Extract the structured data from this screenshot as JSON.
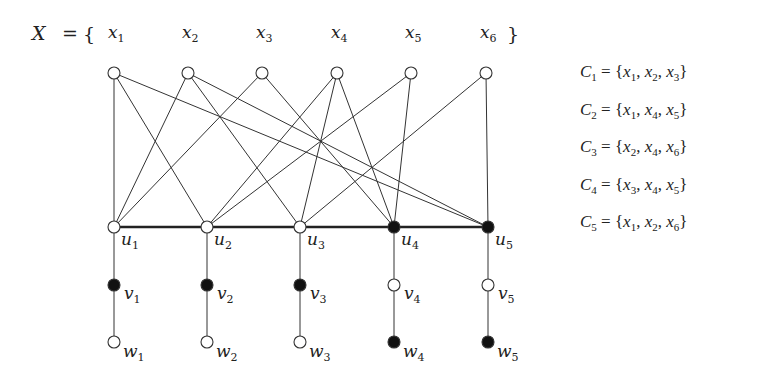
{
  "header": {
    "set_name": "X",
    "equals": "=",
    "open_brace": "{",
    "close_brace": "}"
  },
  "variables": [
    {
      "name": "x",
      "sub": "1",
      "x": 114
    },
    {
      "name": "x",
      "sub": "2",
      "x": 188
    },
    {
      "name": "x",
      "sub": "3",
      "x": 262
    },
    {
      "name": "x",
      "sub": "4",
      "x": 337
    },
    {
      "name": "x",
      "sub": "5",
      "x": 411
    },
    {
      "name": "x",
      "sub": "6",
      "x": 486
    }
  ],
  "clauses": [
    {
      "name": "C",
      "sub": "1",
      "members": [
        "1",
        "2",
        "3"
      ],
      "text": "C1 = {x1, x2, x3}"
    },
    {
      "name": "C",
      "sub": "2",
      "members": [
        "1",
        "4",
        "5"
      ],
      "text": "C2 = {x1, x4, x5}"
    },
    {
      "name": "C",
      "sub": "3",
      "members": [
        "2",
        "4",
        "6"
      ],
      "text": "C3 = {x2, x4, x6}"
    },
    {
      "name": "C",
      "sub": "4",
      "members": [
        "3",
        "4",
        "5"
      ],
      "text": "C4 = {x3, x4, x5}"
    },
    {
      "name": "C",
      "sub": "5",
      "members": [
        "1",
        "2",
        "6"
      ],
      "text": "C5 = {x1, x2, x6}"
    }
  ],
  "u_nodes": [
    {
      "label": "u",
      "sub": "1",
      "x": 114,
      "filled": false
    },
    {
      "label": "u",
      "sub": "2",
      "x": 207,
      "filled": false
    },
    {
      "label": "u",
      "sub": "3",
      "x": 300,
      "filled": false
    },
    {
      "label": "u",
      "sub": "4",
      "x": 394,
      "filled": true
    },
    {
      "label": "u",
      "sub": "5",
      "x": 488,
      "filled": true
    }
  ],
  "v_nodes": [
    {
      "label": "v",
      "sub": "1",
      "filled": true
    },
    {
      "label": "v",
      "sub": "2",
      "filled": true
    },
    {
      "label": "v",
      "sub": "3",
      "filled": true
    },
    {
      "label": "v",
      "sub": "4",
      "filled": false
    },
    {
      "label": "v",
      "sub": "5",
      "filled": false
    }
  ],
  "w_nodes": [
    {
      "label": "w",
      "sub": "1",
      "filled": false
    },
    {
      "label": "w",
      "sub": "2",
      "filled": false
    },
    {
      "label": "w",
      "sub": "3",
      "filled": false
    },
    {
      "label": "w",
      "sub": "4",
      "filled": true
    },
    {
      "label": "w",
      "sub": "5",
      "filled": true
    }
  ],
  "layout": {
    "x_row_y": 73,
    "u_row_y": 227,
    "v_row_y": 285,
    "w_row_y": 342,
    "node_radius": 6,
    "stroke_color": "#333333",
    "filled_color": "#111111"
  }
}
